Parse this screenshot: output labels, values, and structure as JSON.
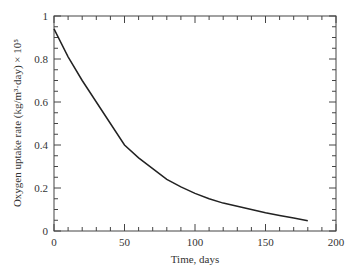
{
  "chart_data": {
    "type": "line",
    "title": "",
    "xlabel": "Time, days",
    "ylabel": "Oxygen uptake rate (kg/m³·day) × 10⁵",
    "xlim": [
      0,
      200
    ],
    "ylim": [
      0,
      1
    ],
    "x_ticks": [
      "0",
      "50",
      "100",
      "150",
      "200"
    ],
    "y_ticks": [
      "0",
      "0.2",
      "0.4",
      "0.6",
      "0.8",
      "1"
    ],
    "grid": false,
    "legend": null,
    "series": [
      {
        "name": "Oxygen uptake rate",
        "x": [
          0,
          10,
          20,
          30,
          40,
          50,
          60,
          70,
          80,
          90,
          100,
          110,
          120,
          130,
          140,
          150,
          160,
          170,
          180
        ],
        "y": [
          0.94,
          0.81,
          0.7,
          0.6,
          0.5,
          0.4,
          0.34,
          0.29,
          0.24,
          0.205,
          0.175,
          0.15,
          0.13,
          0.115,
          0.1,
          0.085,
          0.072,
          0.06,
          0.048
        ]
      }
    ]
  }
}
